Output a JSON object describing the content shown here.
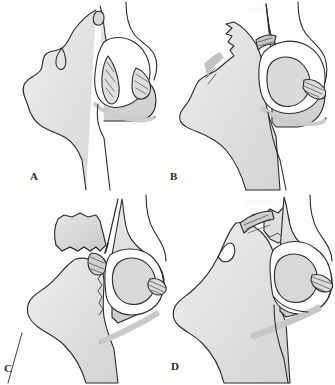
{
  "figure": {
    "background_color": "#fdfdfc",
    "ink_color": "#2b2b2b",
    "bone_fill_light": "#ececec",
    "bone_fill_mid": "#dcdcdc",
    "bone_fill_dark": "#c9c9c9",
    "ligament_fill": "#d5d5d5",
    "panel_count": 4
  },
  "panels": [
    {
      "id": "a",
      "label": "A",
      "caption": "",
      "description": "Lateral view of hip joint with intact femoral head seated in acetabulum; ligamentum teres visible; superior labrum intact."
    },
    {
      "id": "b",
      "label": "B",
      "caption": "",
      "description": "Lateral view with displaced bone fragment separated from the acetabular rim; joint capsule and ligaments stretched."
    },
    {
      "id": "c",
      "label": "C",
      "caption": "",
      "description": "Lateral view with large free osteochondral fragment rotated away from the joint; femoral head exposed."
    },
    {
      "id": "d",
      "label": "D",
      "caption": "",
      "description": "Lateral view with fragment reduced and reapproximated to the acetabular rim; ligaments reattached."
    }
  ],
  "labels": {
    "a": "A",
    "b": "B",
    "c": "C",
    "d": "D"
  },
  "scan_artifacts": {
    "present": true,
    "bleed_lines": [
      "of the",
      "and the",
      "fracture",
      "reduction"
    ]
  }
}
